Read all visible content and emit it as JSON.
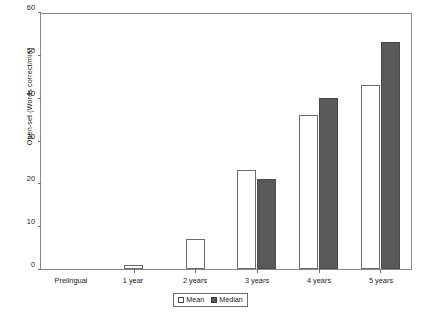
{
  "chart_data": {
    "type": "bar",
    "title": "",
    "xlabel": "",
    "ylabel": "Open-set (Words correct/min)",
    "categories": [
      "Prelingual",
      "1 year",
      "2 years",
      "3 years",
      "4 years",
      "5 years"
    ],
    "series": [
      {
        "name": "Mean",
        "values": [
          0,
          1,
          7,
          23,
          36,
          43
        ]
      },
      {
        "name": "Median",
        "values": [
          0,
          0,
          0,
          21,
          40,
          53
        ]
      }
    ],
    "ylim": [
      0,
      60
    ],
    "yticks": [
      0,
      10,
      20,
      30,
      40,
      50,
      60
    ],
    "ytick_labels": [
      "0",
      "10",
      "20",
      "30",
      "40",
      "50",
      "60"
    ],
    "grid": false,
    "legend_position": "bottom-center",
    "colors": {
      "mean_fill": "#ffffff",
      "mean_stroke": "#6b6b6b",
      "median_fill": "#595959",
      "median_stroke": "#4a4a4a",
      "axis": "#8a8a8a",
      "text": "#1a1a1a"
    }
  },
  "legend": {
    "items": [
      {
        "label": "Mean",
        "style": "mean"
      },
      {
        "label": "Median",
        "style": "median"
      }
    ]
  }
}
